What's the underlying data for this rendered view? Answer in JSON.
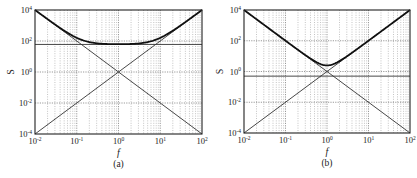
{
  "chart_data": [
    {
      "type": "line",
      "panel_label": "(a)",
      "xlabel": "f",
      "ylabel": "S",
      "xscale": "log",
      "yscale": "log",
      "xlim": [
        0.01,
        100
      ],
      "ylim": [
        0.0001,
        10000
      ],
      "grid": true,
      "x_ticks": [
        "10^-2",
        "10^-1",
        "10^0",
        "10^1",
        "10^2"
      ],
      "y_ticks": [
        "10^-4",
        "10^-2",
        "10^0",
        "10^2",
        "10^4"
      ],
      "series": [
        {
          "name": "f^-2 asymptote",
          "style": "thin",
          "x": [
            0.01,
            100
          ],
          "values": [
            10000,
            0.0001
          ]
        },
        {
          "name": "f^2 asymptote",
          "style": "thin",
          "x": [
            0.01,
            100
          ],
          "values": [
            0.0001,
            10000
          ]
        },
        {
          "name": "constant",
          "style": "thin",
          "x": [
            0.01,
            100
          ],
          "values": [
            60,
            60
          ]
        },
        {
          "name": "total S = f^-2 + f^2 + C",
          "style": "thick",
          "constant": 60,
          "x": [
            0.01,
            0.03,
            0.1,
            0.3,
            1,
            3,
            10,
            30,
            100
          ],
          "values": [
            10000,
            1171,
            160,
            71,
            62,
            71,
            160,
            1171,
            10000
          ]
        }
      ]
    },
    {
      "type": "line",
      "panel_label": "(b)",
      "xlabel": "f",
      "ylabel": "S",
      "xscale": "log",
      "yscale": "log",
      "xlim": [
        0.01,
        100
      ],
      "ylim": [
        0.0001,
        10000
      ],
      "grid": true,
      "x_ticks": [
        "10^-2",
        "10^-1",
        "10^0",
        "10^1",
        "10^2"
      ],
      "y_ticks": [
        "10^-4",
        "10^-2",
        "10^0",
        "10^2",
        "10^4"
      ],
      "series": [
        {
          "name": "f^-2 asymptote",
          "style": "thin",
          "x": [
            0.01,
            100
          ],
          "values": [
            10000,
            0.0001
          ]
        },
        {
          "name": "f^2 asymptote",
          "style": "thin",
          "x": [
            0.01,
            100
          ],
          "values": [
            0.0001,
            10000
          ]
        },
        {
          "name": "constant",
          "style": "thin",
          "x": [
            0.01,
            100
          ],
          "values": [
            0.5,
            0.5
          ]
        },
        {
          "name": "total S = f^-2 + f^2 + C",
          "style": "thick",
          "constant": 0.5,
          "x": [
            0.01,
            0.1,
            0.3,
            1,
            3,
            10,
            100
          ],
          "values": [
            10000,
            100.5,
            12.1,
            2.5,
            12.1,
            100.5,
            10000
          ]
        }
      ]
    }
  ],
  "panels": [
    {
      "label": "(a)",
      "xlabel": "f",
      "ylabel": "S"
    },
    {
      "label": "(b)",
      "xlabel": "f",
      "ylabel": "S"
    }
  ],
  "tick_labels": {
    "x": [
      {
        "base": "10",
        "exp": "-2"
      },
      {
        "base": "10",
        "exp": "-1"
      },
      {
        "base": "10",
        "exp": "0"
      },
      {
        "base": "10",
        "exp": "1"
      },
      {
        "base": "10",
        "exp": "2"
      }
    ],
    "y": [
      {
        "base": "10",
        "exp": "4"
      },
      {
        "base": "10",
        "exp": "2"
      },
      {
        "base": "10",
        "exp": "0"
      },
      {
        "base": "10",
        "exp": "-2"
      },
      {
        "base": "10",
        "exp": "-4"
      }
    ]
  }
}
